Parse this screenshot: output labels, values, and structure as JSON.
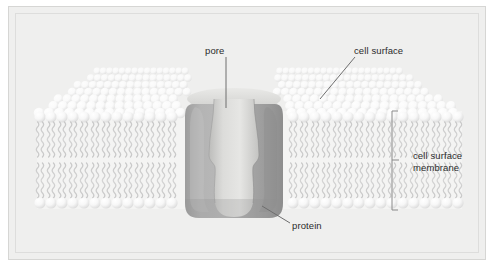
{
  "diagram": {
    "type": "biology-cross-section",
    "background_color": "#efefee",
    "frame_border_color": "#d6d6d4"
  },
  "labels": {
    "pore": "pore",
    "cell_surface": "cell surface",
    "protein": "protein",
    "cell_surface_membrane_line1": "cell surface",
    "cell_surface_membrane_line2": "membrane"
  },
  "structures": {
    "phospholipid_head_color": "#fafafa",
    "phospholipid_tail_color": "#cfcfcf",
    "protein_color": "#adadad",
    "protein_shadow_color": "#8f8f8f",
    "pore_color": "#d8d8d6",
    "leader_line_color": "#6e6e6e",
    "bracket_color": "#8a8a8a",
    "text_color": "#2b2b2b"
  },
  "geometry": {
    "upper_leaflet_head_row_y": 110,
    "lower_leaflet_head_row_y": 196,
    "bracket_top_y": 104,
    "bracket_bottom_y": 203,
    "pore_constriction_y": 155,
    "protein_left_x": 178,
    "protein_right_x": 272
  }
}
